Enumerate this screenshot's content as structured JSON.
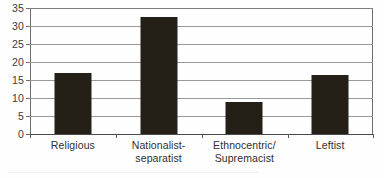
{
  "figure": {
    "background_color": "#fefefe",
    "bar_color": "#242018",
    "gridline_color": "#9a9a9a",
    "axis_color": "#4a4a4a",
    "label_color": "#2f2f2f"
  },
  "chart_data": {
    "type": "bar",
    "title": "",
    "subtitle": "",
    "xlabel": "",
    "ylabel": "",
    "categories": [
      "Religious",
      "Nationalist-separatist",
      "Ethnocentric/Supremacist",
      "Leftist"
    ],
    "category_lines": [
      [
        "Religious"
      ],
      [
        "Nationalist-",
        "separatist"
      ],
      [
        "Ethnocentric/",
        "Supremacist"
      ],
      [
        "Leftist"
      ]
    ],
    "values": [
      17,
      32.5,
      8.8,
      16.5
    ],
    "ylim": [
      0,
      35
    ],
    "ytick_step": 5,
    "yticks": [
      0,
      5,
      10,
      15,
      20,
      25,
      30,
      35
    ],
    "ytick_labels": [
      "0",
      "5",
      "10",
      "15",
      "20",
      "25",
      "30",
      "35"
    ],
    "grid": true,
    "grid_orientation": "horizontal",
    "legend": false,
    "legend_position": "none",
    "annotations": [],
    "series": [
      {
        "name": "",
        "values": [
          17,
          32.5,
          8.8,
          16.5
        ]
      }
    ]
  }
}
